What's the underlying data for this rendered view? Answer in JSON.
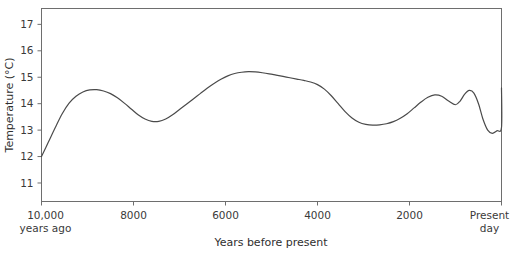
{
  "chart_data": {
    "type": "line",
    "title": "",
    "xlabel": "Years before present",
    "ylabel": "Temperature (°C)",
    "xlim": [
      10000,
      0
    ],
    "ylim": [
      10.3,
      17.6
    ],
    "grid": false,
    "legend": "none",
    "x_tick_values": [
      10000,
      8000,
      6000,
      4000,
      2000,
      0
    ],
    "x_tick_labels": [
      "10,000",
      "8000",
      "6000",
      "4000",
      "2000",
      "Present"
    ],
    "x_tick_sublabels": [
      "years ago",
      "",
      "",
      "",
      "",
      "day"
    ],
    "y_tick_values": [
      11,
      12,
      13,
      14,
      15,
      16,
      17
    ],
    "y_tick_labels": [
      "11",
      "12",
      "13",
      "14",
      "15",
      "16",
      "17"
    ],
    "line_color": "#4a4a4a",
    "axis_color": "#6e6e6e",
    "text_color": "#3a3a3a",
    "series": [
      {
        "name": "Holocene temperature",
        "x": [
          10000,
          9850,
          9700,
          9550,
          9400,
          9250,
          9100,
          8950,
          8800,
          8650,
          8500,
          8350,
          8200,
          8050,
          7900,
          7750,
          7600,
          7450,
          7300,
          7150,
          7000,
          6850,
          6700,
          6550,
          6400,
          6250,
          6100,
          5950,
          5800,
          5650,
          5500,
          5350,
          5200,
          5050,
          4900,
          4750,
          4600,
          4450,
          4300,
          4150,
          4000,
          3850,
          3700,
          3550,
          3400,
          3250,
          3100,
          2950,
          2800,
          2650,
          2500,
          2350,
          2200,
          2050,
          1900,
          1750,
          1600,
          1450,
          1300,
          1150,
          1000,
          900,
          800,
          700,
          600,
          500,
          400,
          300,
          200,
          100,
          0
        ],
        "y": [
          12.0,
          12.55,
          13.1,
          13.62,
          14.02,
          14.28,
          14.44,
          14.52,
          14.53,
          14.48,
          14.38,
          14.22,
          14.02,
          13.8,
          13.58,
          13.42,
          13.33,
          13.33,
          13.42,
          13.58,
          13.78,
          13.98,
          14.18,
          14.38,
          14.58,
          14.76,
          14.92,
          15.05,
          15.14,
          15.19,
          15.21,
          15.2,
          15.17,
          15.13,
          15.08,
          15.03,
          14.98,
          14.93,
          14.88,
          14.82,
          14.72,
          14.55,
          14.3,
          14.0,
          13.7,
          13.46,
          13.3,
          13.22,
          13.19,
          13.2,
          13.24,
          13.32,
          13.45,
          13.62,
          13.84,
          14.06,
          14.24,
          14.33,
          14.28,
          14.1,
          13.96,
          14.1,
          14.36,
          14.5,
          14.4,
          14.0,
          13.4,
          13.0,
          12.88,
          12.98,
          13.1
        ],
        "annotations": [
          {
            "label": "early Holocene rise",
            "x": 10000,
            "y": 12.0
          },
          {
            "label": "early warm peak",
            "x": 8950,
            "y": 14.52
          },
          {
            "label": "8.2 ka cool event",
            "x": 7600,
            "y": 13.33
          },
          {
            "label": "Holocene climatic optimum",
            "x": 5500,
            "y": 15.21
          },
          {
            "label": "neoglacial cooling trough",
            "x": 2800,
            "y": 13.19
          },
          {
            "label": "Roman warm period",
            "x": 1450,
            "y": 14.33
          },
          {
            "label": "Medieval warm period",
            "x": 700,
            "y": 14.5
          },
          {
            "label": "Little Ice Age minimum",
            "x": 200,
            "y": 12.88
          },
          {
            "label": "present day",
            "x": 0,
            "y": 13.1
          }
        ]
      }
    ],
    "present_day_endpoint": {
      "x": 0,
      "y": 14.6
    }
  }
}
